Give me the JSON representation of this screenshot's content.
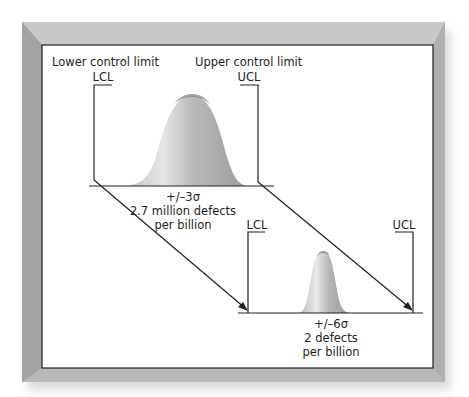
{
  "diagram": {
    "title_labels": {
      "lower_control_limit": "Lower control limit",
      "upper_control_limit": "Upper control limit"
    },
    "top_distribution": {
      "lcl_label": "LCL",
      "ucl_label": "UCL",
      "sigma_label": "+/–3σ",
      "defects_line1": "2.7 million defects",
      "defects_line2": "per billion"
    },
    "bottom_distribution": {
      "lcl_label": "LCL",
      "ucl_label": "UCL",
      "sigma_label": "+/–6σ",
      "defects_line1": "2 defects",
      "defects_line2": "per billion"
    },
    "colors": {
      "frame": "#b3b3b3",
      "frame_dark": "#9a9a9a",
      "panel": "#ffffff",
      "line": "#231f20",
      "bell_light": "#d9d9d9",
      "bell_dark": "#a6a6a6"
    }
  }
}
